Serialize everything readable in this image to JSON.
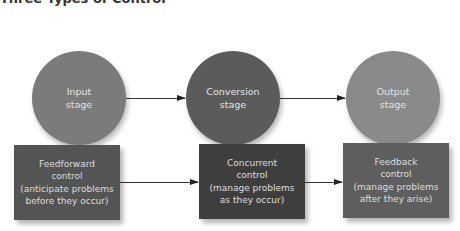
{
  "title": "Three Types of Control",
  "stages": [
    {
      "id": "input",
      "lines": [
        "Input",
        "stage"
      ],
      "color": "#7b7b7b"
    },
    {
      "id": "conversion",
      "lines": [
        "Conversion",
        "stage"
      ],
      "color": "#5b5b5b"
    },
    {
      "id": "output",
      "lines": [
        "Output",
        "stage"
      ],
      "color": "#8a8a8a"
    }
  ],
  "controls": [
    {
      "id": "feedforward",
      "lines": [
        "Feedforward",
        "control",
        "(anticipate problems",
        "before they occur)"
      ],
      "color": "#545454"
    },
    {
      "id": "concurrent",
      "lines": [
        "Concurrent",
        "control",
        "(manage problems",
        "as they occur)"
      ],
      "color": "#3e3e3e"
    },
    {
      "id": "feedback",
      "lines": [
        "Feedback",
        "control",
        "(manage problems",
        "after they arise)"
      ],
      "color": "#5e5e5e"
    }
  ]
}
